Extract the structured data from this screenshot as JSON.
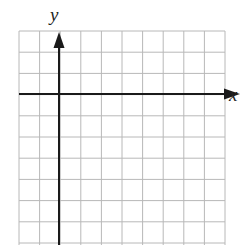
{
  "diagram": {
    "type": "coordinate-plane",
    "grid": {
      "columns": 10,
      "rows": 10,
      "color": "#b8b8b8"
    },
    "axes": {
      "color": "#1a1a1a",
      "x_label": "x",
      "y_label": "y",
      "origin_cell": {
        "col": 2,
        "row": 3
      }
    }
  }
}
